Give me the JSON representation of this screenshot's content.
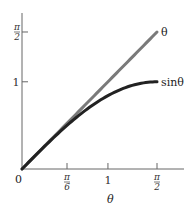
{
  "chart_data": {
    "type": "line",
    "title": "",
    "xlabel": "θ",
    "ylabel": "",
    "xlim": [
      0,
      1.7
    ],
    "ylim": [
      0,
      1.79
    ],
    "grid": false,
    "x_ticks": [
      {
        "value": 0,
        "label_num": "0",
        "label_den": ""
      },
      {
        "value": 0.5236,
        "label_num": "π",
        "label_den": "6"
      },
      {
        "value": 1,
        "label_num": "1",
        "label_den": ""
      },
      {
        "value": 1.5708,
        "label_num": "π",
        "label_den": "2"
      }
    ],
    "y_ticks": [
      {
        "value": 1,
        "label_num": "1",
        "label_den": ""
      },
      {
        "value": 1.5708,
        "label_num": "π",
        "label_den": "2"
      }
    ],
    "series": [
      {
        "name": "θ",
        "label": "θ",
        "function": "identity",
        "color": "#7a7a7a",
        "x": [
          0,
          0.2618,
          0.5236,
          0.7854,
          1.0472,
          1.309,
          1.5708
        ],
        "y": [
          0,
          0.2618,
          0.5236,
          0.7854,
          1.0472,
          1.309,
          1.5708
        ]
      },
      {
        "name": "sinθ",
        "label": "sinθ",
        "function": "sin",
        "color": "#222222",
        "x": [
          0,
          0.2618,
          0.5236,
          0.7854,
          1.0472,
          1.309,
          1.5708
        ],
        "y": [
          0,
          0.2588,
          0.5,
          0.7071,
          0.866,
          0.9659,
          1.0
        ]
      }
    ],
    "origin_label": "0"
  }
}
